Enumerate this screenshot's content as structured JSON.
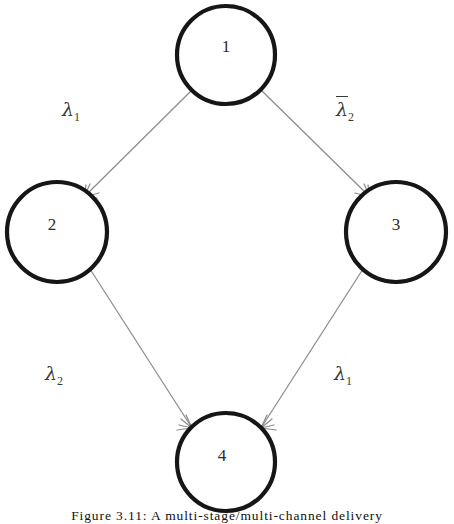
{
  "diagram": {
    "nodes": [
      {
        "id": "1",
        "label": "1",
        "cx": 226,
        "cy": 55,
        "r": 49
      },
      {
        "id": "2",
        "label": "2",
        "cx": 57,
        "cy": 232,
        "r": 50
      },
      {
        "id": "3",
        "label": "3",
        "cx": 396,
        "cy": 232,
        "r": 50
      },
      {
        "id": "4",
        "label": "4",
        "cx": 226,
        "cy": 462,
        "r": 49
      }
    ],
    "edges": [
      {
        "from": "1",
        "to": "2",
        "label": "λ",
        "subscript": "1",
        "overline": false
      },
      {
        "from": "1",
        "to": "3",
        "label": "λ",
        "subscript": "2",
        "overline": true
      },
      {
        "from": "2",
        "to": "4",
        "label": "λ",
        "subscript": "2",
        "overline": false
      },
      {
        "from": "3",
        "to": "4",
        "label": "λ",
        "subscript": "1",
        "overline": true
      }
    ],
    "colors": {
      "node_stroke": "#161616",
      "node_fill": "#ffffff",
      "edge_stroke": "#8c8c8c",
      "label_text": "#3a3a3a",
      "background": "#ffffff"
    }
  },
  "caption": {
    "text": "Figure 3.11: A multi-stage/multi-channel delivery",
    "visible": "clipped"
  }
}
